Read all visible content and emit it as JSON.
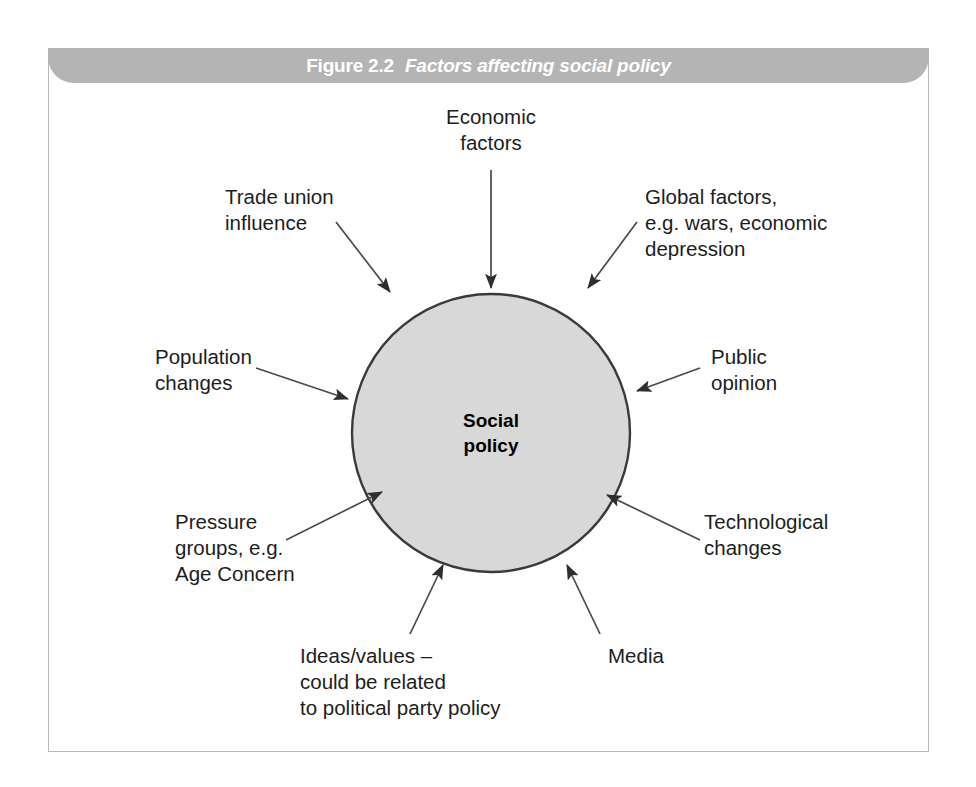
{
  "figure": {
    "number": "Figure 2.2",
    "title": "Factors affecting social policy",
    "banner_color": "#b4b4b4",
    "frame_color": "#b9b9b9"
  },
  "diagram": {
    "type": "hub-and-spoke",
    "center": {
      "label": "Social\npolicy",
      "shape": "circle",
      "fill_color": "#d8d8d8",
      "stroke_color": "#3a3a3a"
    },
    "factors": [
      {
        "id": "economic-factors",
        "label": "Economic\nfactors",
        "direction": "into-circle",
        "position": "top"
      },
      {
        "id": "trade-union-influence",
        "label": "Trade union\ninfluence",
        "direction": "into-circle",
        "position": "top-left"
      },
      {
        "id": "global-factors",
        "label": "Global factors,\ne.g. wars, economic\ndepression",
        "direction": "into-circle",
        "position": "top-right"
      },
      {
        "id": "population-changes",
        "label": "Population\nchanges",
        "direction": "into-circle",
        "position": "left"
      },
      {
        "id": "public-opinion",
        "label": "Public\nopinion",
        "direction": "into-circle",
        "position": "right"
      },
      {
        "id": "pressure-groups",
        "label": "Pressure\ngroups, e.g.\nAge Concern",
        "direction": "into-circle",
        "position": "bottom-left"
      },
      {
        "id": "technological-changes",
        "label": "Technological\nchanges",
        "direction": "into-circle",
        "position": "bottom-right"
      },
      {
        "id": "ideas-values",
        "label": "Ideas/values –\ncould be related\nto political party policy",
        "direction": "into-circle",
        "position": "bottom"
      },
      {
        "id": "media",
        "label": "Media",
        "direction": "into-circle",
        "position": "bottom-right-inner"
      }
    ]
  }
}
